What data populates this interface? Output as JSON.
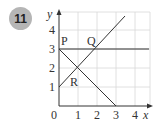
{
  "question_number": "11",
  "diagram": {
    "x_axis_label": "x",
    "y_axis_label": "y",
    "origin_label": "0",
    "x_ticks": [
      "1",
      "2",
      "3",
      "4"
    ],
    "y_ticks": [
      "1",
      "2",
      "3",
      "4"
    ],
    "points": {
      "P": {
        "label": "P",
        "x": 0,
        "y": 3
      },
      "Q": {
        "label": "Q",
        "x": 2,
        "y": 3
      },
      "R": {
        "label": "R",
        "x": 1,
        "y": 2
      }
    },
    "lines": [
      {
        "name": "y = 3",
        "from": [
          0,
          3
        ],
        "to": [
          4.8,
          3
        ]
      },
      {
        "name": "y = x + 1",
        "from": [
          0,
          1
        ],
        "to": [
          3.6,
          4.6
        ]
      },
      {
        "name": "y = 3 - x",
        "from": [
          0,
          3
        ],
        "to": [
          3,
          0
        ]
      }
    ],
    "line_color": "#333333",
    "grid_color": "#d8d8d8"
  }
}
